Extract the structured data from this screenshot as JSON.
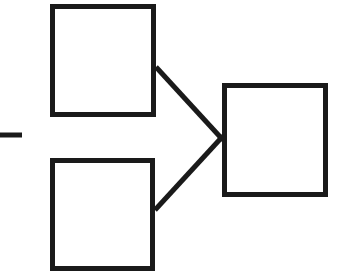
{
  "diagram": {
    "background_color": "#ffffff",
    "stroke_color": "#1a1a1a",
    "stroke_width": 5,
    "canvas": {
      "width": 351,
      "height": 277
    },
    "nodes": [
      {
        "id": "node-top-left",
        "label": "",
        "shape": "rectangle",
        "x": 50,
        "y": 4,
        "width": 106,
        "height": 113,
        "fill": "#ffffff",
        "stroke": "#1a1a1a"
      },
      {
        "id": "node-bottom-left",
        "label": "",
        "shape": "rectangle",
        "x": 50,
        "y": 158,
        "width": 105,
        "height": 113,
        "fill": "#ffffff",
        "stroke": "#1a1a1a"
      },
      {
        "id": "node-right",
        "label": "",
        "shape": "rectangle",
        "x": 222,
        "y": 83,
        "width": 106,
        "height": 114,
        "fill": "#ffffff",
        "stroke": "#1a1a1a"
      }
    ],
    "connectors": [
      {
        "id": "connector-top-to-right",
        "from": "node-top-left",
        "to": "node-right",
        "x1": 156,
        "y1": 67,
        "x2": 223,
        "y2": 140,
        "stroke": "#1a1a1a"
      },
      {
        "id": "connector-bottom-to-right",
        "from": "node-bottom-left",
        "to": "node-right",
        "x1": 155,
        "y1": 210,
        "x2": 223,
        "y2": 136,
        "stroke": "#1a1a1a"
      }
    ],
    "marks": [
      {
        "id": "left-edge-dash",
        "shape": "horizontal-line",
        "x1": 0,
        "y1": 135,
        "x2": 22,
        "y2": 135,
        "stroke": "#1a1a1a"
      }
    ]
  }
}
